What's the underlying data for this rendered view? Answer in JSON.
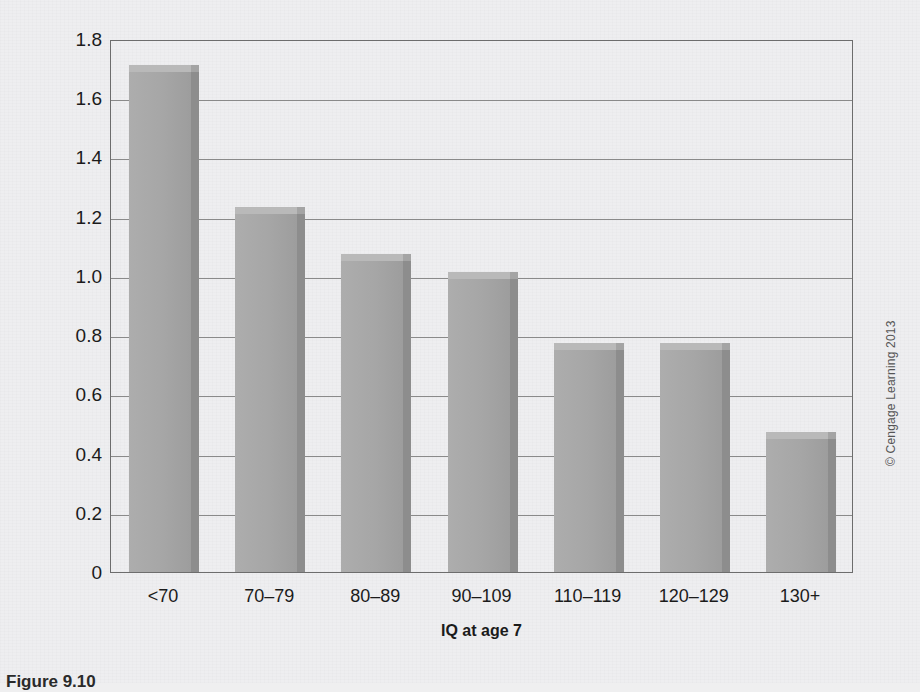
{
  "figure": {
    "caption": "Figure 9.10",
    "copyright": "© Cengage Learning 2013"
  },
  "chart_data": {
    "type": "bar",
    "title": "",
    "xlabel": "IQ at age 7",
    "ylabel": "Relative mortality rate",
    "categories": [
      "<70",
      "70–79",
      "80–89",
      "90–109",
      "110–119",
      "120–129",
      "130+"
    ],
    "values": [
      1.69,
      1.21,
      1.05,
      0.99,
      0.75,
      0.75,
      0.45
    ],
    "ylim": [
      0,
      1.8
    ],
    "yticks": [
      "0",
      "0.2",
      "0.4",
      "0.6",
      "0.8",
      "1.0",
      "1.2",
      "1.4",
      "1.6",
      "1.8"
    ],
    "ytick_values": [
      0,
      0.2,
      0.4,
      0.6,
      0.8,
      1.0,
      1.2,
      1.4,
      1.6,
      1.8
    ],
    "grid": true,
    "legend": null,
    "bar_color": "#a6a6a6",
    "bar_side_color": "#8d8d8d",
    "bar_top_color": "#b9b9b9",
    "axis_color": "#6d6d6d",
    "grid_color": "#8a8a8a"
  }
}
